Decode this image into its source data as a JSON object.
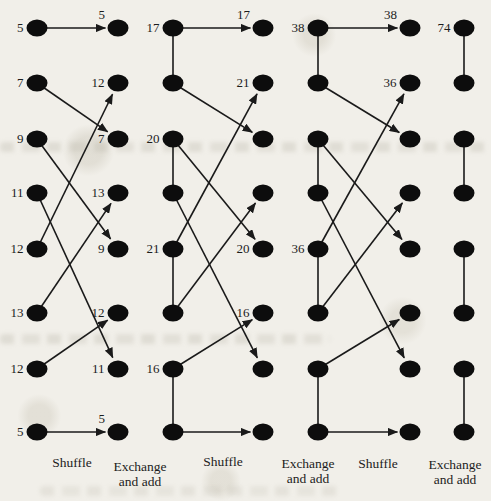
{
  "figure": {
    "background": "#f1efe9",
    "ink_color": "#1a1a1a",
    "label_color": "#1c1c1c",
    "dot_color": "#0d0d0d",
    "rows_y": [
      28,
      83,
      139,
      193,
      249,
      313,
      369,
      432
    ],
    "columns": [
      {
        "x": 37,
        "pair_links": false,
        "labels": [
          "5",
          "7",
          "9",
          "11",
          "12",
          "13",
          "12",
          "5"
        ]
      },
      {
        "x": 118,
        "pair_links": false,
        "labels": [
          "",
          "12",
          "7",
          "13",
          "9",
          "12",
          "11",
          ""
        ]
      },
      {
        "x": 173,
        "pair_links": true,
        "labels": [
          "17",
          "",
          "20",
          "",
          "21",
          "",
          "16",
          ""
        ]
      },
      {
        "x": 263,
        "pair_links": false,
        "labels": [
          "",
          "21",
          "",
          "",
          "20",
          "16",
          "",
          ""
        ]
      },
      {
        "x": 318,
        "pair_links": true,
        "labels": [
          "38",
          "",
          "",
          "",
          "36",
          "",
          "",
          ""
        ]
      },
      {
        "x": 410,
        "pair_links": false,
        "labels": [
          "",
          "36",
          "",
          "",
          "",
          "",
          "",
          ""
        ]
      },
      {
        "x": 464,
        "pair_links": true,
        "labels": [
          "74",
          "",
          "",
          "",
          "",
          "",
          "",
          ""
        ]
      }
    ],
    "shuffle_map": [
      [
        1,
        1
      ],
      [
        2,
        3
      ],
      [
        3,
        5
      ],
      [
        4,
        7
      ],
      [
        5,
        2
      ],
      [
        6,
        4
      ],
      [
        7,
        6
      ],
      [
        8,
        8
      ]
    ],
    "shuffle_stages": [
      {
        "from_col": 0,
        "to_col": 1,
        "arrow_labels": {
          "1": "5",
          "8": "5"
        }
      },
      {
        "from_col": 2,
        "to_col": 3,
        "arrow_labels": {
          "1": "17"
        }
      },
      {
        "from_col": 4,
        "to_col": 5,
        "arrow_labels": {
          "1": "38"
        }
      }
    ],
    "exchange_pairs": [
      [
        1,
        2
      ],
      [
        3,
        4
      ],
      [
        5,
        6
      ],
      [
        7,
        8
      ]
    ],
    "stage_labels": [
      {
        "text": "Shuffle"
      },
      {
        "text": "Exchange\nand add"
      },
      {
        "text": "Shuffle"
      },
      {
        "text": "Exchange\nand add"
      },
      {
        "text": "Shuffle"
      },
      {
        "text": "Exchange\nand add"
      }
    ]
  }
}
